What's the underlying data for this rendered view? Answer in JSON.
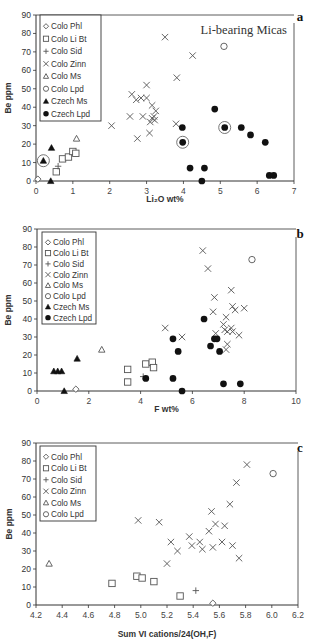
{
  "chart_data": [
    {
      "id": "a",
      "type": "scatter",
      "panel_label": "a",
      "title": "Li-bearing Micas",
      "xlabel": "Li2O wt%",
      "ylabel": "Be ppm",
      "xlim": [
        0,
        7
      ],
      "ylim": [
        0,
        90
      ],
      "xticks": [
        0,
        1,
        2,
        3,
        4,
        5,
        6,
        7
      ],
      "yticks": [
        0,
        10,
        20,
        30,
        40,
        50,
        60,
        70,
        80,
        90
      ],
      "grid": false,
      "legend_position": "upper-left",
      "legend": [
        "Colo Phl",
        "Colo Li Bt",
        "Colo Sid",
        "Colo Zinn",
        "Colo Ms",
        "Colo Lpd",
        "Czech Ms",
        "Czech Lpd"
      ],
      "series": [
        {
          "name": "Colo Phl",
          "marker": "diamond-open",
          "points": [
            [
              0.05,
              1
            ]
          ]
        },
        {
          "name": "Colo Li Bt",
          "marker": "square-open",
          "points": [
            [
              0.55,
              5
            ],
            [
              0.72,
              12
            ],
            [
              0.88,
              13
            ],
            [
              1.0,
              16
            ],
            [
              1.08,
              15
            ]
          ]
        },
        {
          "name": "Colo Sid",
          "marker": "plus",
          "points": [
            [
              0.6,
              8
            ]
          ]
        },
        {
          "name": "Colo Zinn",
          "marker": "x",
          "points": [
            [
              3.5,
              78
            ],
            [
              4.25,
              68
            ],
            [
              3.82,
              56
            ],
            [
              3.0,
              52
            ],
            [
              2.6,
              47
            ],
            [
              2.85,
              45
            ],
            [
              2.72,
              44
            ],
            [
              3.0,
              45
            ],
            [
              3.15,
              41
            ],
            [
              3.25,
              38
            ],
            [
              3.2,
              35
            ],
            [
              3.1,
              32
            ],
            [
              3.22,
              33
            ],
            [
              3.15,
              34
            ],
            [
              2.55,
              35
            ],
            [
              2.9,
              35
            ],
            [
              3.8,
              31
            ],
            [
              2.05,
              30
            ],
            [
              3.08,
              26
            ],
            [
              2.75,
              23
            ]
          ]
        },
        {
          "name": "Colo Ms",
          "marker": "triangle-open",
          "points": [
            [
              1.1,
              23
            ]
          ]
        },
        {
          "name": "Colo Lpd",
          "marker": "circle-open",
          "points": [
            [
              5.1,
              73
            ]
          ]
        },
        {
          "name": "Czech Ms",
          "marker": "triangle-filled",
          "points": [
            [
              0.2,
              11
            ],
            [
              0.42,
              18
            ],
            [
              0.4,
              0
            ]
          ]
        },
        {
          "name": "Czech Lpd",
          "marker": "circle-filled",
          "points": [
            [
              4.85,
              39
            ],
            [
              3.97,
              29
            ],
            [
              5.12,
              29
            ],
            [
              5.57,
              29
            ],
            [
              5.82,
              25
            ],
            [
              6.22,
              21
            ],
            [
              3.98,
              21
            ],
            [
              4.18,
              7
            ],
            [
              4.57,
              7
            ],
            [
              4.5,
              0
            ],
            [
              6.33,
              3
            ],
            [
              6.45,
              3
            ]
          ]
        }
      ],
      "highlighted_points": [
        [
          0.2,
          11
        ],
        [
          3.98,
          21
        ],
        [
          5.12,
          29
        ]
      ]
    },
    {
      "id": "b",
      "type": "scatter",
      "panel_label": "b",
      "xlabel": "F wt%",
      "ylabel": "Be ppm",
      "xlim": [
        0,
        10
      ],
      "ylim": [
        0,
        90
      ],
      "xticks": [
        0,
        2,
        4,
        6,
        8,
        10
      ],
      "yticks": [
        0,
        10,
        20,
        30,
        40,
        50,
        60,
        70,
        80,
        90
      ],
      "grid": false,
      "legend_position": "upper-left",
      "legend": [
        "Colo Phl",
        "Colo Li Bt",
        "Colo Sid",
        "Colo Zinn",
        "Colo Ms",
        "Colo Lpd",
        "Czech Ms",
        "Czech Lpd"
      ],
      "series": [
        {
          "name": "Colo Phl",
          "marker": "diamond-open",
          "points": [
            [
              1.5,
              1
            ]
          ]
        },
        {
          "name": "Colo Li Bt",
          "marker": "square-open",
          "points": [
            [
              3.5,
              12
            ],
            [
              3.5,
              5
            ],
            [
              4.2,
              15
            ],
            [
              4.45,
              16
            ],
            [
              4.5,
              13
            ]
          ]
        },
        {
          "name": "Colo Sid",
          "marker": "plus",
          "points": [
            [
              4.1,
              8
            ]
          ]
        },
        {
          "name": "Colo Zinn",
          "marker": "x",
          "points": [
            [
              6.4,
              78
            ],
            [
              6.6,
              68
            ],
            [
              7.5,
              56
            ],
            [
              6.85,
              52
            ],
            [
              7.55,
              47
            ],
            [
              7.65,
              45
            ],
            [
              8.0,
              46
            ],
            [
              6.8,
              44
            ],
            [
              7.3,
              41
            ],
            [
              7.2,
              37
            ],
            [
              7.25,
              34
            ],
            [
              7.5,
              35
            ],
            [
              7.35,
              33
            ],
            [
              7.55,
              33
            ],
            [
              7.8,
              31
            ],
            [
              6.9,
              32
            ],
            [
              4.95,
              35
            ],
            [
              5.6,
              30
            ],
            [
              7.35,
              26
            ],
            [
              7.3,
              23
            ]
          ]
        },
        {
          "name": "Colo Ms",
          "marker": "triangle-open",
          "points": [
            [
              2.5,
              23
            ]
          ]
        },
        {
          "name": "Colo Lpd",
          "marker": "circle-open",
          "points": [
            [
              8.3,
              73
            ]
          ]
        },
        {
          "name": "Czech Ms",
          "marker": "triangle-filled",
          "points": [
            [
              0.65,
              11
            ],
            [
              0.8,
              11
            ],
            [
              0.95,
              11
            ],
            [
              1.55,
              18
            ],
            [
              1.05,
              0
            ]
          ]
        },
        {
          "name": "Czech Lpd",
          "marker": "circle-filled",
          "points": [
            [
              6.45,
              40
            ],
            [
              5.25,
              29
            ],
            [
              6.85,
              29
            ],
            [
              6.95,
              29
            ],
            [
              6.7,
              25
            ],
            [
              5.45,
              22
            ],
            [
              7.05,
              22
            ],
            [
              4.2,
              7
            ],
            [
              5.25,
              7
            ],
            [
              5.6,
              0
            ],
            [
              7.2,
              4
            ],
            [
              7.85,
              4
            ]
          ]
        }
      ]
    },
    {
      "id": "c",
      "type": "scatter",
      "panel_label": "c",
      "xlabel": "Sum VI cations/24(OH,F)",
      "ylabel": "Be ppm",
      "xlim": [
        4.2,
        6.2
      ],
      "ylim": [
        0,
        90
      ],
      "xticks": [
        4.2,
        4.4,
        4.6,
        4.8,
        5.0,
        5.2,
        5.4,
        5.6,
        5.8,
        6.0,
        6.2
      ],
      "yticks": [
        0,
        10,
        20,
        30,
        40,
        50,
        60,
        70,
        80,
        90
      ],
      "grid": false,
      "legend_position": "upper-left",
      "legend": [
        "Colo Phl",
        "Colo Li Bt",
        "Colo Sid",
        "Colo Zinn",
        "Colo Ms",
        "Colo Lpd"
      ],
      "series": [
        {
          "name": "Colo Phl",
          "marker": "diamond-open",
          "points": [
            [
              5.55,
              1
            ]
          ]
        },
        {
          "name": "Colo Li Bt",
          "marker": "square-open",
          "points": [
            [
              4.78,
              12
            ],
            [
              4.97,
              16
            ],
            [
              5.01,
              15
            ],
            [
              5.1,
              13
            ],
            [
              5.3,
              5
            ]
          ]
        },
        {
          "name": "Colo Sid",
          "marker": "plus",
          "points": [
            [
              5.42,
              8
            ]
          ]
        },
        {
          "name": "Colo Zinn",
          "marker": "x",
          "points": [
            [
              5.81,
              78
            ],
            [
              5.73,
              68
            ],
            [
              5.68,
              56
            ],
            [
              5.54,
              52
            ],
            [
              4.98,
              47
            ],
            [
              5.14,
              46
            ],
            [
              5.57,
              45
            ],
            [
              5.64,
              44
            ],
            [
              5.52,
              41
            ],
            [
              5.37,
              38
            ],
            [
              5.23,
              35
            ],
            [
              5.45,
              35
            ],
            [
              5.62,
              35
            ],
            [
              5.39,
              33
            ],
            [
              5.7,
              33
            ],
            [
              5.55,
              32
            ],
            [
              5.47,
              31
            ],
            [
              5.28,
              30
            ],
            [
              5.75,
              26
            ],
            [
              5.2,
              23
            ]
          ]
        },
        {
          "name": "Colo Ms",
          "marker": "triangle-open",
          "points": [
            [
              4.3,
              23
            ]
          ]
        },
        {
          "name": "Colo Lpd",
          "marker": "circle-open",
          "points": [
            [
              6.01,
              73
            ]
          ]
        }
      ]
    }
  ],
  "legend_labels": {
    "phl": "Colo Phl",
    "libt": "Colo Li Bt",
    "sid": "Colo Sid",
    "zinn": "Colo Zinn",
    "ms": "Colo Ms",
    "lpd": "Colo Lpd",
    "czms": "Czech Ms",
    "czlpd": "Czech Lpd"
  },
  "panels": {
    "a": {
      "label": "a",
      "title": "Li-bearing Micas",
      "xlabel": "Li₂O wt%",
      "ylabel": "Be ppm"
    },
    "b": {
      "label": "b",
      "xlabel": "F wt%",
      "ylabel": "Be ppm"
    },
    "c": {
      "label": "c",
      "xlabel": "Sum VI cations/24(OH,F)",
      "ylabel": "Be ppm"
    }
  }
}
